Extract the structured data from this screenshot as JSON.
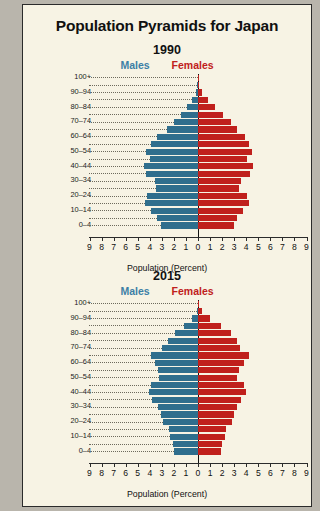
{
  "page": {
    "title": "Population Pyramids for Japan",
    "source_note": "Data from the U.S. Census Bureau."
  },
  "legend": {
    "males": "Males",
    "females": "Females"
  },
  "axis": {
    "xlabel": "Population (Percent)",
    "ticks": [
      "9",
      "8",
      "7",
      "6",
      "5",
      "4",
      "3",
      "2",
      "1",
      "0",
      "1",
      "2",
      "3",
      "4",
      "5",
      "6",
      "7",
      "8",
      "9"
    ],
    "max": 9
  },
  "age_groups": [
    "100+",
    "95-99",
    "90-94",
    "85-89",
    "80-84",
    "75-79",
    "70-74",
    "65-69",
    "60-64",
    "55-59",
    "50-54",
    "45-49",
    "40-44",
    "35-39",
    "30-34",
    "25-29",
    "20-24",
    "15-19",
    "10-14",
    "5-9",
    "0-4"
  ],
  "age_labels_shown": [
    "100+",
    "90-94",
    "80-84",
    "70-74",
    "60-64",
    "50-54",
    "40-44",
    "30-34",
    "20-24",
    "10-14",
    "0-4"
  ],
  "colors": {
    "male": "#2f6e8d",
    "female": "#c0201c",
    "background": "#f7f3e4",
    "frame": "#2b2b2b"
  },
  "chart_data": [
    {
      "type": "bar",
      "title": "1990",
      "subtype": "population-pyramid",
      "xlabel": "Population (Percent)",
      "ylabel": "",
      "xlim": [
        0,
        9
      ],
      "grid": false,
      "legend_position": "top",
      "categories": [
        "100+",
        "95-99",
        "90-94",
        "85-89",
        "80-84",
        "75-79",
        "70-74",
        "65-69",
        "60-64",
        "55-59",
        "50-54",
        "45-49",
        "40-44",
        "35-39",
        "30-34",
        "25-29",
        "20-24",
        "15-19",
        "10-14",
        "5-9",
        "0-4"
      ],
      "series": [
        {
          "name": "Males",
          "values": [
            0.0,
            0.05,
            0.2,
            0.5,
            0.9,
            1.4,
            2.0,
            2.6,
            3.4,
            3.9,
            4.3,
            4.0,
            4.5,
            4.3,
            3.6,
            3.5,
            4.2,
            4.4,
            3.9,
            3.4,
            3.1
          ]
        },
        {
          "name": "Females",
          "values": [
            0.01,
            0.1,
            0.35,
            0.8,
            1.4,
            2.1,
            2.7,
            3.2,
            3.9,
            4.2,
            4.5,
            4.1,
            4.6,
            4.3,
            3.6,
            3.4,
            4.1,
            4.2,
            3.7,
            3.2,
            3.0
          ]
        }
      ]
    },
    {
      "type": "bar",
      "title": "2015",
      "subtype": "population-pyramid",
      "xlabel": "Population (Percent)",
      "ylabel": "",
      "xlim": [
        0,
        9
      ],
      "grid": false,
      "legend_position": "top",
      "categories": [
        "100+",
        "95-99",
        "90-94",
        "85-89",
        "80-84",
        "75-79",
        "70-74",
        "65-69",
        "60-64",
        "55-59",
        "50-54",
        "45-49",
        "40-44",
        "35-39",
        "30-34",
        "25-29",
        "20-24",
        "15-19",
        "10-14",
        "5-9",
        "0-4"
      ],
      "series": [
        {
          "name": "Males",
          "values": [
            0.0,
            0.1,
            0.5,
            1.2,
            1.9,
            2.5,
            3.0,
            3.9,
            3.6,
            3.3,
            3.2,
            3.9,
            4.1,
            3.8,
            3.3,
            3.1,
            2.9,
            2.4,
            2.3,
            2.1,
            2.0
          ]
        },
        {
          "name": "Females",
          "values": [
            0.05,
            0.3,
            1.0,
            1.9,
            2.7,
            3.2,
            3.5,
            4.2,
            3.8,
            3.4,
            3.2,
            3.8,
            4.0,
            3.6,
            3.2,
            3.0,
            2.8,
            2.3,
            2.2,
            2.0,
            1.9
          ]
        }
      ]
    }
  ]
}
